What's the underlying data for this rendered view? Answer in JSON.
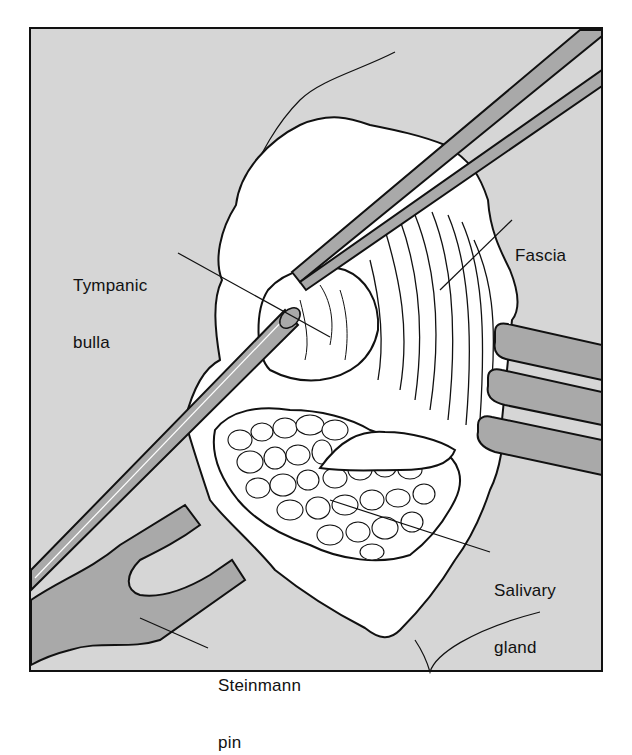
{
  "figure": {
    "type": "surgical-illustration",
    "frame": {
      "background": "#d6d6d6",
      "border": "#111111"
    },
    "colors": {
      "tissue": "#ffffff",
      "instrument": "#a9a9a9",
      "outline": "#111111"
    }
  },
  "labels": {
    "tympanic_bulla": {
      "line1": "Tympanic",
      "line2": "bulla"
    },
    "fascia": {
      "line1": "Fascia"
    },
    "salivary_gland": {
      "line1": "Salivary",
      "line2": "gland"
    },
    "steinmann_pin": {
      "line1": "Steinmann",
      "line2": "pin"
    }
  }
}
